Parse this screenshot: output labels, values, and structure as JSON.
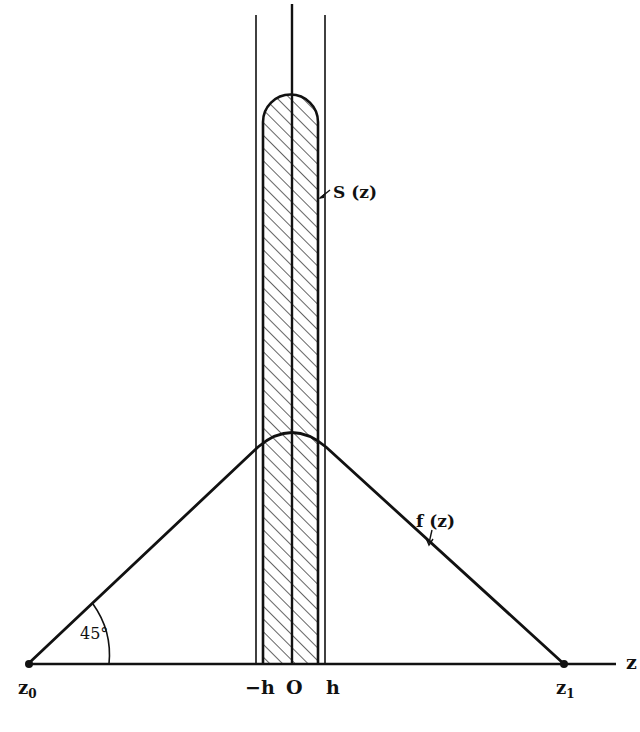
{
  "diagram": {
    "labels": {
      "S": "S (z)",
      "f": "f (z)",
      "angle": "45°",
      "z0": "z",
      "z0_sub": "0",
      "z1": "z",
      "z1_sub": "1",
      "neg_h": "−h",
      "origin": "O",
      "h": "h",
      "axis": "z"
    },
    "colors": {
      "ink": "#111111",
      "background": "#ffffff"
    }
  }
}
